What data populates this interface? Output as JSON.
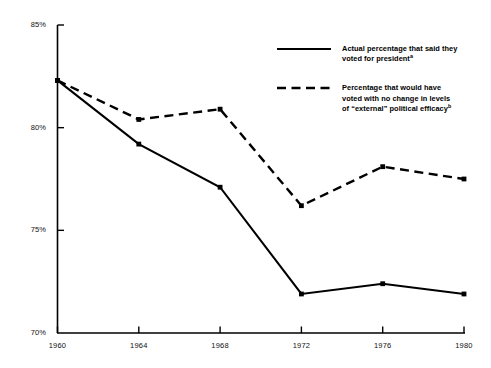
{
  "chart_data": {
    "type": "line",
    "title": "",
    "subtitle": "",
    "xlabel": "",
    "ylabel": "",
    "categories": [
      "1960",
      "1964",
      "1968",
      "1972",
      "1976",
      "1980"
    ],
    "x": [
      1960,
      1964,
      1968,
      1972,
      1976,
      1980
    ],
    "xlim": [
      1960,
      1980
    ],
    "ylim": [
      70,
      85
    ],
    "grid": false,
    "legend_position": "upper-right",
    "y_tick_labels": [
      "85%",
      "80%",
      "75%",
      "70%"
    ],
    "y_tick_values": [
      85,
      80,
      75,
      70
    ],
    "series": [
      {
        "name": "Actual percentage that said they voted for president",
        "note_marker": "a",
        "style": "solid",
        "color": "#000000",
        "values": [
          82.3,
          79.2,
          77.1,
          71.9,
          72.4,
          71.9
        ]
      },
      {
        "name": "Percentage that would have voted with no change in levels of \"external\" political efficacy",
        "note_marker": "b",
        "style": "dashed",
        "color": "#000000",
        "values": [
          82.3,
          80.4,
          80.9,
          76.2,
          78.1,
          77.5
        ]
      }
    ]
  },
  "legend": {
    "entries": [
      {
        "id": "legend-solid",
        "line1": "Actual percentage that said they",
        "line2": "voted for president",
        "superscript": "a",
        "style": "solid"
      },
      {
        "id": "legend-dashed",
        "line1": "Percentage that would have",
        "line2": "voted with no change in levels",
        "line3": "of “external” political efficacy",
        "superscript": "b",
        "style": "dashed"
      }
    ]
  },
  "axes": {
    "y_labels": [
      "85%",
      "80%",
      "75%",
      "70%"
    ],
    "x_labels": [
      "1960",
      "1964",
      "1968",
      "1972",
      "1976",
      "1980"
    ]
  },
  "colors": {
    "ink": "#000000",
    "background": "#ffffff"
  }
}
